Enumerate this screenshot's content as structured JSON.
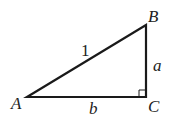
{
  "diagram": {
    "type": "right-triangle",
    "vertices": {
      "A": {
        "label": "A",
        "x": 27,
        "y": 97
      },
      "B": {
        "label": "B",
        "x": 146,
        "y": 25
      },
      "C": {
        "label": "C",
        "x": 146,
        "y": 97
      }
    },
    "sides": {
      "hypotenuse": {
        "label": "1",
        "from": "A",
        "to": "B"
      },
      "vertical": {
        "label": "a",
        "from": "B",
        "to": "C"
      },
      "horizontal": {
        "label": "b",
        "from": "A",
        "to": "C"
      }
    },
    "right_angle_at": "C",
    "line_color": "#1a1a1a"
  }
}
